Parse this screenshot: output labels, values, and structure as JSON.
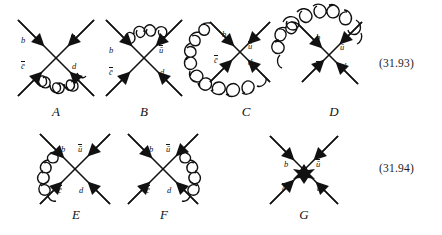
{
  "page": {
    "background": "#ffffff",
    "ink": "#111111",
    "width": 442,
    "height": 235
  },
  "equations": [
    {
      "id": "eq-3193",
      "number": "(31.93)"
    },
    {
      "id": "eq-3194",
      "number": "(31.94)"
    }
  ],
  "particles": {
    "b": "b",
    "cbar": "c̄",
    "ubar": "ū",
    "d": "d"
  },
  "rows": [
    {
      "id": "row-1",
      "equation": "(31.93)",
      "diagrams": [
        {
          "id": "diagram-a",
          "label": "A",
          "gluon": "bottom-arc",
          "gluon_description": "gluon arc below the vertex connecting the c-bar and d legs",
          "legs": [
            {
              "name": "b",
              "label": "b",
              "position": "upper-left"
            },
            {
              "name": "ubar",
              "label": "ū",
              "position": "upper-right"
            },
            {
              "name": "cbar",
              "label": "c̄",
              "position": "lower-left"
            },
            {
              "name": "d",
              "label": "d",
              "position": "lower-right"
            }
          ]
        },
        {
          "id": "diagram-b",
          "label": "B",
          "gluon": "top-arc",
          "gluon_description": "gluon arc above the vertex connecting the b and u-bar legs",
          "legs": [
            {
              "name": "b",
              "label": "b",
              "position": "upper-left"
            },
            {
              "name": "ubar",
              "label": "ū",
              "position": "upper-right"
            },
            {
              "name": "cbar",
              "label": "c̄",
              "position": "lower-left"
            },
            {
              "name": "d",
              "label": "d",
              "position": "lower-right"
            }
          ]
        },
        {
          "id": "diagram-c",
          "label": "C",
          "gluon": "left-large-arc",
          "gluon_description": "large gluon loop sweeping around the left connecting the b and d legs",
          "legs": [
            {
              "name": "b",
              "label": "b",
              "position": "upper-left"
            },
            {
              "name": "ubar",
              "label": "ū",
              "position": "upper-right"
            },
            {
              "name": "cbar",
              "label": "c̄",
              "position": "lower-left"
            },
            {
              "name": "d",
              "label": "d",
              "position": "lower-right"
            }
          ]
        },
        {
          "id": "diagram-d",
          "label": "D",
          "gluon": "top-large-arc",
          "gluon_description": "large gluon loop sweeping over the top-left connecting the c-bar and u-bar legs",
          "legs": [
            {
              "name": "b",
              "label": "b",
              "position": "upper-left"
            },
            {
              "name": "ubar",
              "label": "ū",
              "position": "upper-right"
            },
            {
              "name": "cbar",
              "label": "c̄",
              "position": "lower-left"
            },
            {
              "name": "d",
              "label": "d",
              "position": "lower-right"
            }
          ]
        }
      ]
    },
    {
      "id": "row-2",
      "equation": "(31.94)",
      "diagrams": [
        {
          "id": "diagram-e",
          "label": "E",
          "gluon": "left-arc",
          "gluon_description": "gluon arc on the left connecting the b and c-bar legs",
          "legs": [
            {
              "name": "b",
              "label": "b",
              "position": "upper-left"
            },
            {
              "name": "ubar",
              "label": "ū",
              "position": "upper-right"
            },
            {
              "name": "cbar",
              "label": "c̄",
              "position": "lower-left"
            },
            {
              "name": "d",
              "label": "d",
              "position": "lower-right"
            }
          ]
        },
        {
          "id": "diagram-f",
          "label": "F",
          "gluon": "right-arc",
          "gluon_description": "gluon arc on the right connecting the u-bar and d legs",
          "legs": [
            {
              "name": "b",
              "label": "b",
              "position": "upper-left"
            },
            {
              "name": "ubar",
              "label": "ū",
              "position": "upper-right"
            },
            {
              "name": "cbar",
              "label": "c̄",
              "position": "lower-left"
            },
            {
              "name": "d",
              "label": "d",
              "position": "lower-right"
            }
          ]
        },
        {
          "id": "diagram-g",
          "label": "G",
          "gluon": "effective-vertex-blob",
          "gluon_description": "filled four-fermion effective vertex blob at the crossing point",
          "legs": [
            {
              "name": "b",
              "label": "b",
              "position": "upper-left"
            },
            {
              "name": "ubar",
              "label": "ū",
              "position": "upper-right"
            },
            {
              "name": "cbar",
              "label": "c̄",
              "position": "lower-left"
            },
            {
              "name": "d",
              "label": "d",
              "position": "lower-right"
            }
          ]
        }
      ]
    }
  ]
}
